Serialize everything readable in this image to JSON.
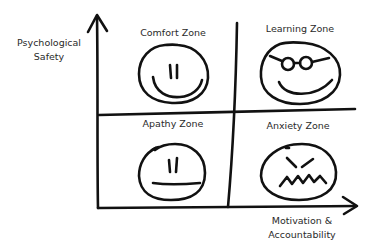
{
  "axes": {
    "y_label_line1": "Psychological",
    "y_label_line2": "Safety",
    "x_label_line1": "Motivation &",
    "x_label_line2": "Accountability"
  },
  "quadrants": {
    "top_left": {
      "title": "Comfort Zone",
      "face": "content-face"
    },
    "top_right": {
      "title": "Learning Zone",
      "face": "glasses-smile-face"
    },
    "bottom_left": {
      "title": "Apathy Zone",
      "face": "flat-mouth-face"
    },
    "bottom_right": {
      "title": "Anxiety Zone",
      "face": "angry-zigzag-face"
    }
  },
  "colors": {
    "ink": "#111111",
    "background": "#ffffff"
  }
}
